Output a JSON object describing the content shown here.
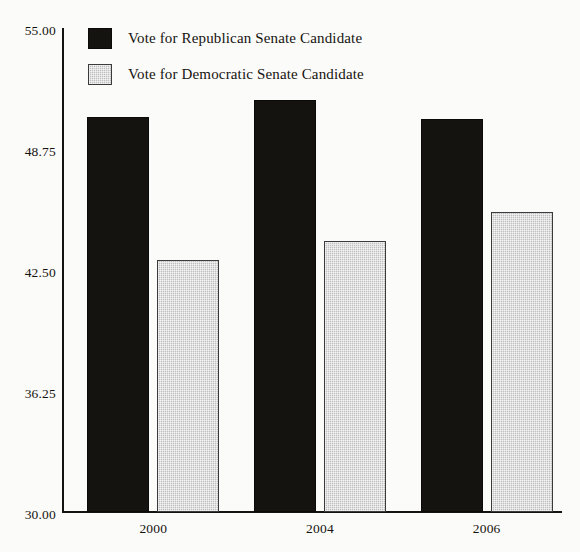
{
  "chart_data": {
    "type": "bar",
    "title": "",
    "subtitle": "",
    "xlabel": "",
    "ylabel": "",
    "categories": [
      "2000",
      "2004",
      "2006"
    ],
    "series": [
      {
        "name": "Vote for Republican Senate Candidate",
        "color": "#151310",
        "values": [
          50.4,
          51.3,
          50.3
        ]
      },
      {
        "name": "Vote for Democratic Senate Candidate",
        "color": "#bfbfbf",
        "values": [
          43.0,
          44.0,
          45.5
        ]
      }
    ],
    "ylim": [
      30.0,
      55.0
    ],
    "yticks": [
      "30.00",
      "36.25",
      "42.50",
      "48.75",
      "55.00"
    ],
    "ytick_values": [
      30.0,
      36.25,
      42.5,
      48.75,
      55.0
    ],
    "xtick_labels": [
      "2000",
      "2004",
      "2006"
    ],
    "grid": false,
    "legend_position": "top-left",
    "annotations": []
  },
  "legend": {
    "items": [
      {
        "label": "Vote for Republican Senate Candidate",
        "swatch": "republican-swatch"
      },
      {
        "label": "Vote for Democratic Senate Candidate",
        "swatch": "democratic-swatch"
      }
    ]
  },
  "axes": {
    "y_tick_labels": [
      "55.00",
      "48.75",
      "42.50",
      "36.25",
      "30.00"
    ],
    "x_tick_labels": [
      "2000",
      "2004",
      "2006"
    ]
  },
  "colors": {
    "republican": "#151310",
    "democratic": "#bfbfbf",
    "axis": "#15130f",
    "text": "#16130f",
    "background": "#fbfbf9"
  }
}
